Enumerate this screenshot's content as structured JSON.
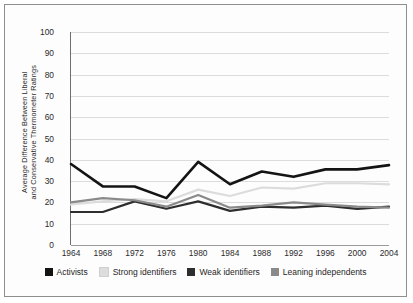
{
  "chart_data": {
    "type": "line",
    "title": "",
    "xlabel": "",
    "ylabel": "Average Difference Between Liberal and Conservative Thermometer Ratings",
    "ylabel_lines": [
      "Average Difference Between Liberal",
      "and Conservative Thermometer Ratings"
    ],
    "categories": [
      1964,
      1968,
      1972,
      1976,
      1980,
      1984,
      1988,
      1992,
      1996,
      2000,
      2004
    ],
    "x_tick_labels": [
      "1964",
      "1968",
      "1972",
      "1976",
      "1980",
      "1984",
      "1988",
      "1992",
      "1996",
      "2000",
      "2004"
    ],
    "y_tick_labels": [
      "0",
      "10",
      "20",
      "30",
      "40",
      "50",
      "60",
      "70",
      "80",
      "90",
      "100"
    ],
    "y_ticks": [
      0,
      10,
      20,
      30,
      40,
      50,
      60,
      70,
      80,
      90,
      100
    ],
    "ylim": [
      0,
      100
    ],
    "grid": "horizontal",
    "legend_position": "bottom",
    "series": [
      {
        "name": "Activists",
        "color": "#141414",
        "width": 2.6,
        "values": [
          38,
          27.5,
          27.5,
          22,
          39,
          28.5,
          34.5,
          32,
          35.5,
          35.5,
          37.5
        ]
      },
      {
        "name": "Strong identifiers",
        "color": "#dcdcdc",
        "width": 2.2,
        "values": [
          19,
          20.5,
          21.5,
          20.5,
          26,
          23,
          27,
          26.5,
          29,
          29,
          28.5
        ]
      },
      {
        "name": "Weak identifiers",
        "color": "#2e2e2e",
        "width": 2.2,
        "values": [
          15.5,
          15.5,
          20.5,
          17,
          20.5,
          16,
          18,
          17.5,
          18.5,
          17,
          18
        ]
      },
      {
        "name": "Leaning independents",
        "color": "#8a8a8a",
        "width": 2.2,
        "values": [
          20,
          22,
          21,
          18,
          23.5,
          17.5,
          18.5,
          20,
          19,
          18,
          17.5
        ]
      }
    ]
  },
  "legend": {
    "items": [
      {
        "label": "Activists",
        "color": "#141414"
      },
      {
        "label": "Strong identifiers",
        "color": "#dcdcdc"
      },
      {
        "label": "Weak identifiers",
        "color": "#2e2e2e"
      },
      {
        "label": "Leaning independents",
        "color": "#8a8a8a"
      }
    ]
  },
  "colors": {
    "frame_border": "#8e8e8e",
    "gridline": "#dcdcdc",
    "axis": "#6f6f6f",
    "text": "#1f1f1f",
    "background": "#ffffff"
  }
}
